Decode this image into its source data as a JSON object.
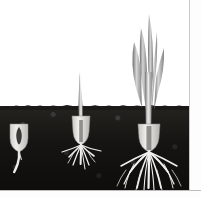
{
  "page": {
    "width": 201,
    "height": 197,
    "background_color": "#fdfdfd"
  },
  "caption": {
    "text": "water and nutrients.",
    "color": "#2b2b2b"
  },
  "illustration": {
    "title": "seed germination stages",
    "subject": "grass or cereal seedling growth sequence",
    "soil_line_y": 106,
    "colors": {
      "soil": "#151412",
      "sky": "#ffffff",
      "seed": "#e8e6e1",
      "root": "#f2f0ec",
      "shoot": "#b9b9b9",
      "leaf": "#9e9e9e",
      "page_rule": "#c9c9c9"
    },
    "stages": [
      {
        "index": 1,
        "label": "seed with emerging radicle",
        "has_shoot": false,
        "has_leaves": false,
        "root_count": 1,
        "above_ground_height_px": 0
      },
      {
        "index": 2,
        "label": "seedling with shoot and spreading roots",
        "has_shoot": true,
        "has_leaves": false,
        "root_count": 8,
        "above_ground_height_px": 34
      },
      {
        "index": 3,
        "label": "young plant with leaves and developed root system",
        "has_shoot": true,
        "has_leaves": true,
        "root_count": 11,
        "above_ground_height_px": 94
      }
    ]
  }
}
